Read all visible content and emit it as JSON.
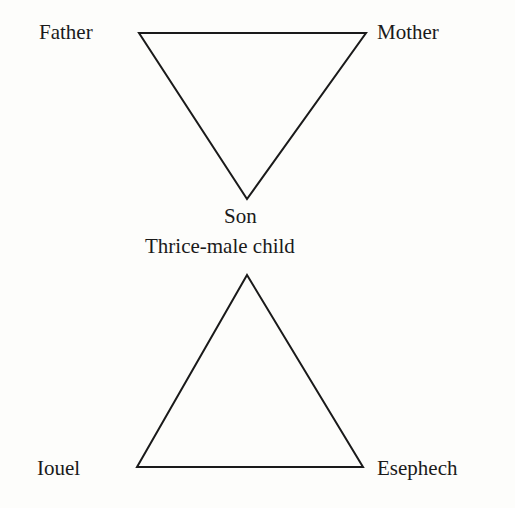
{
  "diagram": {
    "top_triangle": {
      "orientation": "inverted",
      "labels": {
        "left": "Father",
        "right": "Mother",
        "bottom": "Son"
      },
      "vertices": {
        "left": [
          139,
          33
        ],
        "right": [
          366,
          33
        ],
        "bottom": [
          247,
          199
        ]
      }
    },
    "middle_label": "Thrice-male child",
    "bottom_triangle": {
      "orientation": "upright",
      "labels": {
        "left": "Iouel",
        "right": "Esephech"
      },
      "vertices": {
        "apex": [
          247,
          275
        ],
        "left": [
          137,
          467
        ],
        "right": [
          363,
          467
        ]
      }
    },
    "stroke_color": "#1a1a1a",
    "background": "#fdfdfb"
  }
}
